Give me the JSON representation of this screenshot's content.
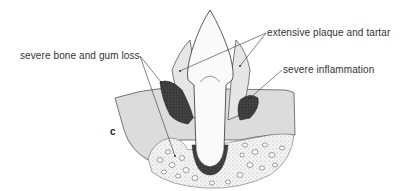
{
  "diagram": {
    "panel_label": "c",
    "labels": {
      "plaque": "extensive plaque and tartar",
      "bone_gum_loss": "severe bone and gum loss",
      "inflammation": "severe inflammation"
    }
  }
}
